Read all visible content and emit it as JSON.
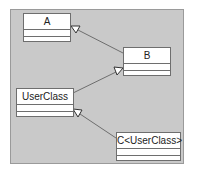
{
  "diagram": {
    "type": "uml-class-diagram",
    "classes": [
      {
        "id": "A",
        "name": "A"
      },
      {
        "id": "B",
        "name": "B"
      },
      {
        "id": "UserClass",
        "name": "UserClass"
      },
      {
        "id": "C",
        "name": "C<UserClass>"
      }
    ],
    "relations": [
      {
        "from": "B",
        "to": "A",
        "kind": "generalization"
      },
      {
        "from": "UserClass",
        "to": "B",
        "kind": "generalization"
      },
      {
        "from": "C<UserClass>",
        "to": "UserClass",
        "kind": "generalization"
      }
    ],
    "colors": {
      "background": "#c9c9c9",
      "box_fill": "#ffffff",
      "line": "#6e6e6e"
    }
  }
}
